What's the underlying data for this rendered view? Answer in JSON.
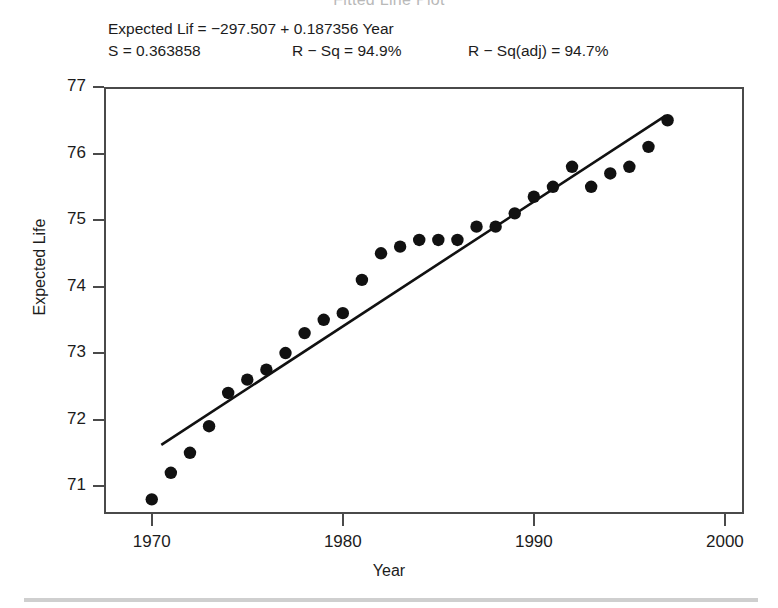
{
  "figure": {
    "clipped_title": "Fitted Line Plot",
    "annotation": {
      "equation": "Expected Lif = −297.507 + 0.187356 Year",
      "s_label": "S = 0.363858",
      "rsq_label": "R − Sq = 94.9%",
      "rsq_adj_label": "R − Sq(adj) = 94.7%"
    }
  },
  "chart_data": {
    "type": "scatter",
    "title": "",
    "xlabel": "Year",
    "ylabel": "Expected Life",
    "xlim": [
      1967.5,
      2001.0
    ],
    "ylim": [
      70.58,
      77.0
    ],
    "xticks": [
      1970,
      1980,
      1990,
      2000
    ],
    "yticks": [
      71,
      72,
      73,
      74,
      75,
      76,
      77
    ],
    "xtick_labels": [
      "1970",
      "1980",
      "1990",
      "2000"
    ],
    "ytick_labels": [
      "71",
      "72",
      "73",
      "74",
      "75",
      "76",
      "77"
    ],
    "grid": false,
    "legend": null,
    "marker_color": "#111111",
    "line_color": "#111111",
    "x": [
      1970,
      1971,
      1972,
      1973,
      1974,
      1975,
      1976,
      1977,
      1978,
      1979,
      1980,
      1981,
      1982,
      1983,
      1984,
      1985,
      1986,
      1987,
      1988,
      1989,
      1990,
      1991,
      1992,
      1993,
      1994,
      1995,
      1996,
      1997
    ],
    "y": [
      70.8,
      71.2,
      71.5,
      71.9,
      72.4,
      72.6,
      72.75,
      73.0,
      73.3,
      73.5,
      73.6,
      74.1,
      74.5,
      74.6,
      74.7,
      74.7,
      74.7,
      74.9,
      74.9,
      75.1,
      75.35,
      75.5,
      75.8,
      75.5,
      75.7,
      75.8,
      76.1,
      76.5
    ],
    "fit_line": {
      "intercept": -297.507,
      "slope": 0.187356,
      "x_start": 1970.5,
      "x_end": 1996.9,
      "y_start": 71.62,
      "y_end": 76.57,
      "equation_text": "Expected Lif = −297.507 + 0.187356 Year"
    },
    "statistics": {
      "S": 0.363858,
      "R_Sq": 94.9,
      "R_Sq_adj": 94.7
    }
  }
}
